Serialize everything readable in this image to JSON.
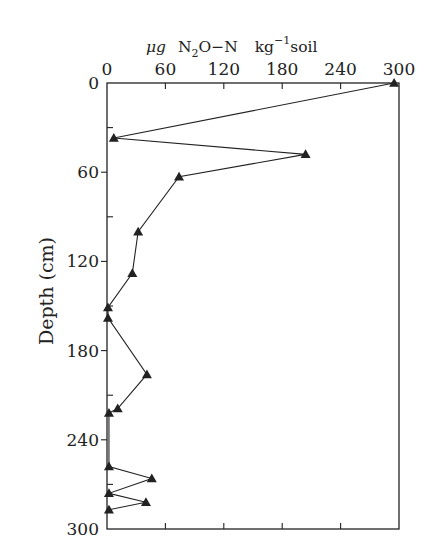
{
  "chart_data": {
    "type": "line",
    "title": "",
    "xlabel": "μg N2O−N kg−1 soil",
    "xlabel_parts": {
      "mu": "μg",
      "n2o_pre": "N",
      "n2o_sub": "2",
      "n2o_post": "O−N",
      "kg": "kg",
      "kg_sup": "−1",
      "soil": "soil"
    },
    "ylabel": "Depth (cm)",
    "xlim": [
      0,
      300
    ],
    "ylim": [
      0,
      300
    ],
    "y_inverted": true,
    "x_axis_position": "top",
    "x_ticks": [
      0,
      60,
      120,
      180,
      240,
      300
    ],
    "y_ticks": [
      0,
      60,
      120,
      180,
      240,
      300
    ],
    "y_minor_ticks": [
      30,
      90,
      150,
      210,
      270
    ],
    "grid": false,
    "legend": null,
    "marker": "triangle",
    "series": [
      {
        "name": "N2O-N",
        "points": [
          {
            "x": 295,
            "y": 0
          },
          {
            "x": 7,
            "y": 37
          },
          {
            "x": 204,
            "y": 48
          },
          {
            "x": 74,
            "y": 63
          },
          {
            "x": 32,
            "y": 100
          },
          {
            "x": 26,
            "y": 128
          },
          {
            "x": 1,
            "y": 151
          },
          {
            "x": 1,
            "y": 158
          },
          {
            "x": 41,
            "y": 196
          },
          {
            "x": 11,
            "y": 219
          },
          {
            "x": 2,
            "y": 222
          },
          {
            "x": 2,
            "y": 258
          },
          {
            "x": 46,
            "y": 266
          },
          {
            "x": 2,
            "y": 276
          },
          {
            "x": 40,
            "y": 282
          },
          {
            "x": 2,
            "y": 287
          }
        ]
      }
    ]
  },
  "colors": {
    "ink": "#222222",
    "background": "#ffffff"
  }
}
